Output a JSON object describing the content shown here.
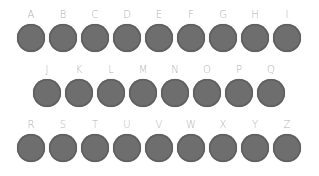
{
  "keyboard": {
    "rows": [
      [
        "A",
        "B",
        "C",
        "D",
        "E",
        "F",
        "G",
        "H",
        "I"
      ],
      [
        "J",
        "K",
        "L",
        "M",
        "N",
        "O",
        "P",
        "Q"
      ],
      [
        "R",
        "S",
        "T",
        "U",
        "V",
        "W",
        "X",
        "Y",
        "Z"
      ]
    ],
    "colors": {
      "key": "#6e6e6e",
      "label": "#b4b4b4",
      "background": "#ffffff"
    }
  }
}
